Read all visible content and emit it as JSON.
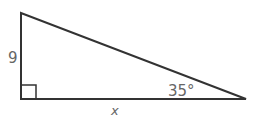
{
  "diagram": {
    "type": "right-triangle",
    "vertices": {
      "top": [
        21,
        13
      ],
      "right_angle": [
        21,
        99
      ],
      "acute": [
        246,
        99
      ]
    },
    "stroke_color": "#333333",
    "label_color": "#666666",
    "labels": {
      "vertical_leg": "9",
      "horizontal_leg": "x",
      "angle": "35°"
    },
    "right_angle_marker": true
  }
}
